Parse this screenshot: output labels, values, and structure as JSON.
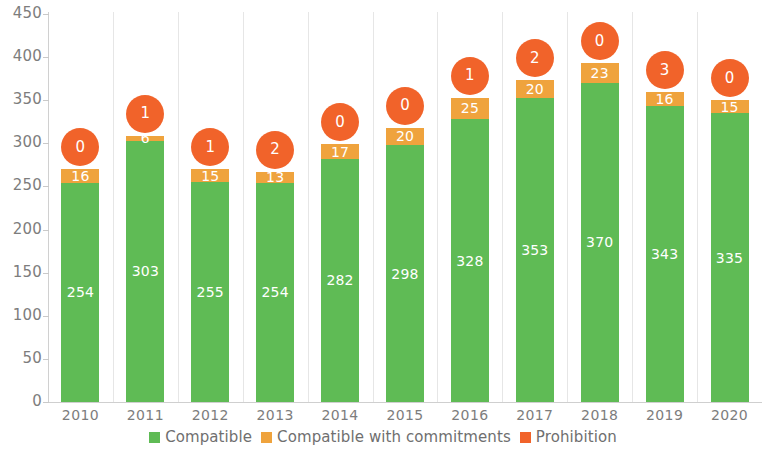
{
  "chart_data": {
    "type": "bar",
    "subtype": "stacked-bar-with-bubble-overlay",
    "title": "",
    "xlabel": "",
    "ylabel": "",
    "ylim": [
      0,
      450
    ],
    "y_ticks": [
      0,
      50,
      100,
      150,
      200,
      250,
      300,
      350,
      400,
      450
    ],
    "y_tick_labels": [
      "0",
      "50",
      "100",
      "150",
      "200",
      "250",
      "300",
      "350",
      "400",
      "450"
    ],
    "grid": "vertical-category-separators",
    "legend_position": "bottom-center",
    "categories": [
      "2010",
      "2011",
      "2012",
      "2013",
      "2014",
      "2015",
      "2016",
      "2017",
      "2018",
      "2019",
      "2020"
    ],
    "series": [
      {
        "name": "Compatible",
        "color": "#5fbb55",
        "render": "stacked-bar-bottom",
        "values": [
          254,
          303,
          255,
          254,
          282,
          298,
          328,
          353,
          370,
          343,
          335
        ],
        "data_labels": [
          "254",
          "303",
          "255",
          "254",
          "282",
          "298",
          "328",
          "353",
          "370",
          "343",
          "335"
        ]
      },
      {
        "name": "Compatible with commitments",
        "color": "#efa33d",
        "render": "stacked-bar-top",
        "values": [
          16,
          6,
          15,
          13,
          17,
          20,
          25,
          20,
          23,
          16,
          15
        ],
        "data_labels": [
          "16",
          "6",
          "15",
          "13",
          "17",
          "20",
          "25",
          "20",
          "23",
          "16",
          "15"
        ]
      },
      {
        "name": "Prohibition",
        "color": "#f1632a",
        "render": "bubble-above-bar",
        "values": [
          0,
          1,
          1,
          2,
          0,
          0,
          1,
          2,
          0,
          3,
          0
        ],
        "data_labels": [
          "0",
          "1",
          "1",
          "2",
          "0",
          "0",
          "1",
          "2",
          "0",
          "3",
          "0"
        ]
      }
    ]
  },
  "legend": {
    "items": [
      {
        "label": "Compatible",
        "color": "#5fbb55"
      },
      {
        "label": "Compatible with commitments",
        "color": "#efa33d"
      },
      {
        "label": "Prohibition",
        "color": "#f1632a"
      }
    ]
  },
  "axis": {
    "y_labels": [
      "450",
      "400",
      "350",
      "300",
      "250",
      "200",
      "150",
      "100",
      "50",
      "0"
    ],
    "x_labels": [
      "2010",
      "2011",
      "2012",
      "2013",
      "2014",
      "2015",
      "2016",
      "2017",
      "2018",
      "2019",
      "2020"
    ]
  }
}
